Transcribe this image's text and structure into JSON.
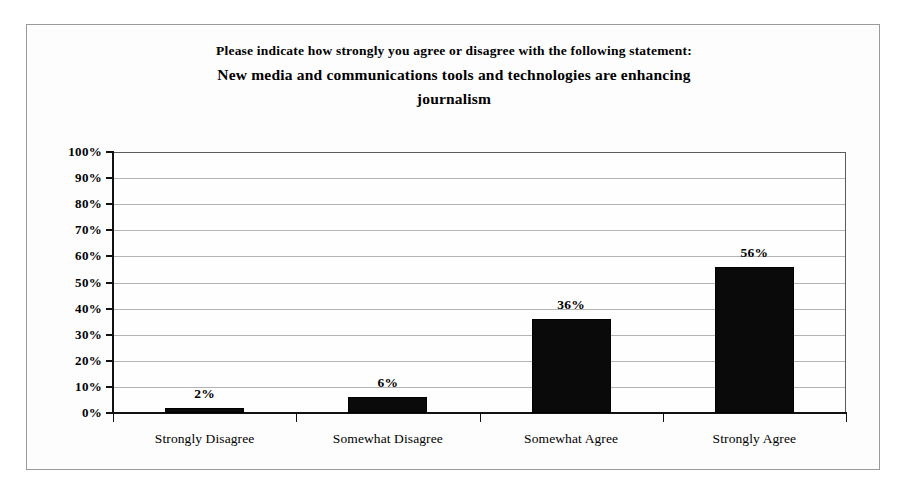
{
  "chart_data": {
    "type": "bar",
    "title": "Please indicate how strongly you agree or disagree with the following statement: New media and communications tools and technologies are enhancing journalism",
    "title_lines": [
      "Please indicate how strongly you agree or disagree with the following statement:",
      "New media and communications tools and technologies are enhancing",
      "journalism"
    ],
    "categories": [
      "Strongly Disagree",
      "Somewhat Disagree",
      "Somewhat Agree",
      "Strongly Agree"
    ],
    "values": [
      2,
      6,
      36,
      56
    ],
    "value_labels": [
      "2%",
      "6%",
      "36%",
      "56%"
    ],
    "xlabel": "",
    "ylabel": "",
    "ylim": [
      0,
      100
    ],
    "ytick_values": [
      0,
      10,
      20,
      30,
      40,
      50,
      60,
      70,
      80,
      90,
      100
    ],
    "ytick_labels": [
      "0%",
      "10%",
      "20%",
      "30%",
      "40%",
      "50%",
      "60%",
      "70%",
      "80%",
      "90%",
      "100%"
    ],
    "grid": true,
    "legend": false,
    "bar_color": "#0a0a0a",
    "gridline_color": "#b4b4b4",
    "axis_color": "#111111",
    "background_color": "#fdfdfd",
    "frame_color": "#9a9a9a"
  }
}
